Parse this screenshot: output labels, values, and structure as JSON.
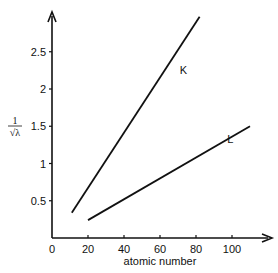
{
  "chart_data": {
    "type": "line",
    "title": "",
    "xlabel": "atomic number",
    "ylabel_num": "1",
    "ylabel_den": "√λ",
    "xlim": [
      0,
      120
    ],
    "ylim": [
      0,
      3
    ],
    "xticks": [
      0,
      20,
      40,
      60,
      80,
      100
    ],
    "xtick_labels": [
      "0",
      "20",
      "40",
      "60",
      "80",
      "100"
    ],
    "yticks": [
      0.5,
      1,
      1.5,
      2,
      2.5
    ],
    "ytick_labels": [
      "0.5",
      "1",
      "1.5",
      "2",
      "2.5"
    ],
    "grid": false,
    "legend": "none",
    "series": [
      {
        "name": "K",
        "label": "K",
        "x": [
          11,
          82
        ],
        "y": [
          0.34,
          2.97
        ],
        "label_at": [
          73,
          2.2
        ]
      },
      {
        "name": "L",
        "label": "L",
        "x": [
          20,
          110
        ],
        "y": [
          0.24,
          1.5
        ],
        "label_at": [
          99,
          1.27
        ]
      }
    ]
  }
}
